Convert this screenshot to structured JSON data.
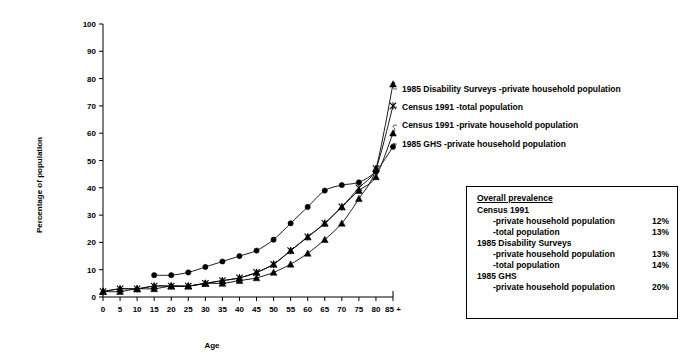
{
  "chart_data": {
    "type": "line",
    "title": "",
    "xlabel": "Age",
    "ylabel": "Percentage of population",
    "xlim": [
      0,
      90
    ],
    "ylim": [
      0,
      100
    ],
    "grid": false,
    "legend_position": "inline-annotations-right",
    "x_tick_labels": [
      "0",
      "5",
      "10",
      "15",
      "20",
      "25",
      "30",
      "35",
      "40",
      "45",
      "50",
      "55",
      "60",
      "65",
      "70",
      "75",
      "80",
      "85 +"
    ],
    "x": [
      0,
      5,
      10,
      15,
      20,
      25,
      30,
      35,
      40,
      45,
      50,
      55,
      60,
      65,
      70,
      75,
      80,
      85
    ],
    "y_tick_labels": [
      "0",
      "10",
      "20",
      "30",
      "40",
      "50",
      "60",
      "70",
      "80",
      "90",
      "100"
    ],
    "y_ticks": [
      0,
      10,
      20,
      30,
      40,
      50,
      60,
      70,
      80,
      90,
      100
    ],
    "series": [
      {
        "name": "1985 Disability Surveys -private household population",
        "marker": "triangle",
        "x": [
          0,
          5,
          10,
          15,
          20,
          25,
          30,
          35,
          40,
          45,
          50,
          55,
          60,
          65,
          70,
          75,
          80,
          85
        ],
        "values": [
          2,
          2,
          3,
          3,
          4,
          4,
          5,
          5,
          6,
          7,
          9,
          12,
          16,
          21,
          27,
          36,
          47,
          78
        ]
      },
      {
        "name": "Census 1991 -total population",
        "marker": "star",
        "x": [
          0,
          5,
          10,
          15,
          20,
          25,
          30,
          35,
          40,
          45,
          50,
          55,
          60,
          65,
          70,
          75,
          80,
          85
        ],
        "values": [
          2,
          3,
          3,
          4,
          4,
          4,
          5,
          6,
          7,
          9,
          12,
          17,
          22,
          27,
          33,
          40,
          47,
          70
        ]
      },
      {
        "name": "Census 1991 -private household population",
        "marker": "triangle",
        "x": [
          0,
          5,
          10,
          15,
          20,
          25,
          30,
          35,
          40,
          45,
          50,
          55,
          60,
          65,
          70,
          75,
          80,
          85
        ],
        "values": [
          2,
          3,
          3,
          4,
          4,
          4,
          5,
          6,
          7,
          9,
          12,
          17,
          22,
          27,
          33,
          39,
          44,
          60
        ]
      },
      {
        "name": "1985 GHS -private household population",
        "marker": "circle",
        "x": [
          15,
          20,
          25,
          30,
          35,
          40,
          45,
          50,
          55,
          60,
          65,
          70,
          75,
          80,
          85
        ],
        "values": [
          8,
          8,
          9,
          11,
          13,
          15,
          17,
          21,
          27,
          33,
          39,
          41,
          42,
          46,
          55
        ]
      }
    ]
  },
  "annotations": [
    {
      "text": "1985 Disability Surveys -private household population"
    },
    {
      "text": "Census 1991 -total population"
    },
    {
      "text": "Census 1991 -private household population"
    },
    {
      "text": "1985 GHS -private household population"
    }
  ],
  "prevalence_box": {
    "title": "Overall prevalence",
    "groups": [
      {
        "name": "Census 1991",
        "rows": [
          {
            "label": "-private household population",
            "value": "12%"
          },
          {
            "label": "-total population",
            "value": "13%"
          }
        ]
      },
      {
        "name": "1985 Disability Surveys",
        "rows": [
          {
            "label": "-private household population",
            "value": "13%"
          },
          {
            "label": "-total population",
            "value": "14%"
          }
        ]
      },
      {
        "name": "1985 GHS",
        "rows": [
          {
            "label": "-private household population",
            "value": "20%"
          }
        ]
      }
    ]
  },
  "colors": {
    "ink": "#000000",
    "paper": "#ffffff"
  }
}
